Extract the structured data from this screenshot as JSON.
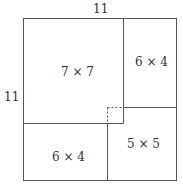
{
  "diagram": {
    "top_label": "11",
    "left_label": "11",
    "regions": [
      {
        "name": "square-7x7",
        "label": "7 × 7"
      },
      {
        "name": "rect-6x4-right",
        "label": "6 × 4"
      },
      {
        "name": "rect-6x4-bottom",
        "label": "6 × 4"
      },
      {
        "name": "square-5x5",
        "label": "5 × 5"
      }
    ],
    "colors": {
      "line": "#444444",
      "background": "#ffffff"
    }
  }
}
